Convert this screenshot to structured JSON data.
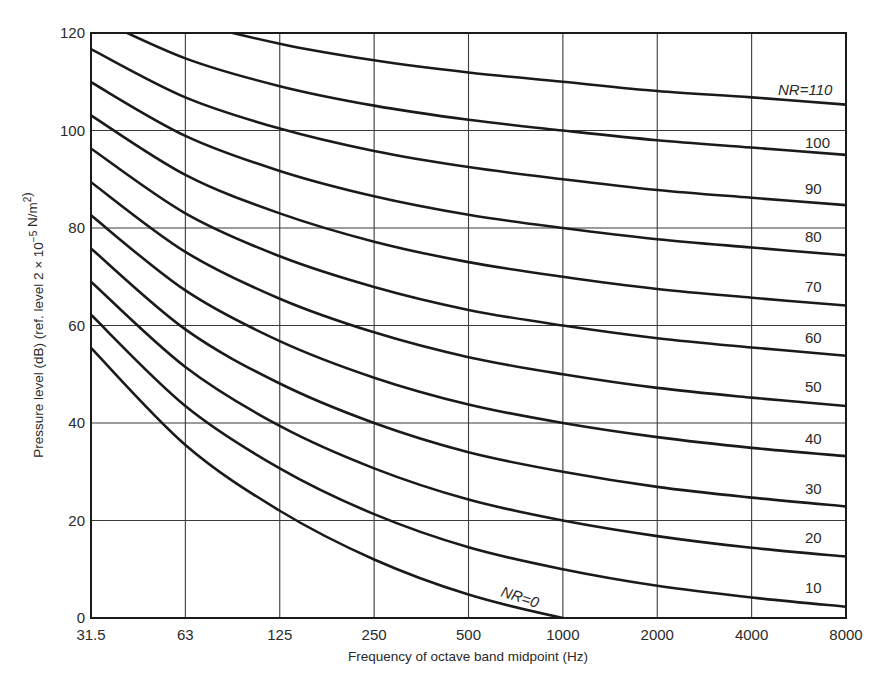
{
  "chart_data": {
    "type": "line",
    "title": "",
    "xlabel": "Frequency of octave band midpoint (Hz)",
    "ylabel": "Pressure level (dB) (ref. level 2 × 10⁻⁵ N/m²)",
    "x": [
      "31.5",
      "63",
      "125",
      "250",
      "500",
      "1000",
      "2000",
      "4000",
      "8000"
    ],
    "yticks": [
      0,
      20,
      40,
      60,
      80,
      100,
      120
    ],
    "ylim": [
      0,
      120
    ],
    "grid": true,
    "legend": "inline curve labels at right",
    "series": [
      {
        "name": "NR=0",
        "label": "NR=0",
        "values": [
          55.4,
          35.5,
          22.0,
          12.0,
          4.8,
          0.0,
          -3.5,
          -6.1,
          -8.0
        ]
      },
      {
        "name": "NR=10",
        "label": "10",
        "values": [
          62.2,
          43.5,
          30.7,
          21.3,
          14.5,
          10.0,
          6.6,
          4.2,
          2.3
        ]
      },
      {
        "name": "NR=20",
        "label": "20",
        "values": [
          69.0,
          51.5,
          39.4,
          30.7,
          24.3,
          20.0,
          16.8,
          14.4,
          12.6
        ]
      },
      {
        "name": "NR=30",
        "label": "30",
        "values": [
          75.8,
          59.2,
          48.1,
          40.0,
          34.0,
          30.0,
          26.9,
          24.7,
          22.9
        ]
      },
      {
        "name": "NR=40",
        "label": "40",
        "values": [
          82.6,
          67.2,
          56.8,
          49.3,
          43.8,
          40.0,
          37.1,
          34.9,
          33.2
        ]
      },
      {
        "name": "NR=50",
        "label": "50",
        "values": [
          89.4,
          75.1,
          65.5,
          58.6,
          53.5,
          50.0,
          47.2,
          45.2,
          43.5
        ]
      },
      {
        "name": "NR=60",
        "label": "60",
        "values": [
          96.3,
          83.0,
          74.2,
          67.9,
          63.2,
          60.0,
          57.4,
          55.5,
          53.8
        ]
      },
      {
        "name": "NR=70",
        "label": "70",
        "values": [
          103.1,
          90.9,
          83.0,
          77.2,
          73.0,
          70.0,
          67.5,
          65.7,
          64.1
        ]
      },
      {
        "name": "NR=80",
        "label": "80",
        "values": [
          109.9,
          98.9,
          91.7,
          86.5,
          82.7,
          80.0,
          77.7,
          76.0,
          74.4
        ]
      },
      {
        "name": "NR=90",
        "label": "90",
        "values": [
          116.7,
          106.8,
          100.4,
          95.8,
          92.5,
          90.0,
          87.8,
          86.2,
          84.7
        ]
      },
      {
        "name": "NR=100",
        "label": "100",
        "values": [
          123.5,
          114.8,
          109.1,
          105.1,
          102.2,
          100.0,
          98.0,
          96.5,
          95.0
        ]
      },
      {
        "name": "NR=110",
        "label": "NR=110",
        "values": [
          130.3,
          122.7,
          117.8,
          114.4,
          111.9,
          110.0,
          108.1,
          106.8,
          105.3
        ]
      }
    ],
    "label_positions": [
      {
        "series": 0,
        "x": 500,
        "y": 596,
        "rotate": 18
      },
      {
        "series": 1,
        "x": 805,
        "y": 593
      },
      {
        "series": 2,
        "x": 805,
        "y": 543
      },
      {
        "series": 3,
        "x": 805,
        "y": 494
      },
      {
        "series": 4,
        "x": 805,
        "y": 444
      },
      {
        "series": 5,
        "x": 805,
        "y": 392
      },
      {
        "series": 6,
        "x": 805,
        "y": 343
      },
      {
        "series": 7,
        "x": 805,
        "y": 292
      },
      {
        "series": 8,
        "x": 805,
        "y": 242
      },
      {
        "series": 9,
        "x": 805,
        "y": 194
      },
      {
        "series": 10,
        "x": 805,
        "y": 148
      },
      {
        "series": 11,
        "x": 778,
        "y": 95
      }
    ]
  },
  "colors": {
    "line": "#1a1a1a",
    "grid": "#3a3a3a",
    "text": "#2a2a2a"
  }
}
